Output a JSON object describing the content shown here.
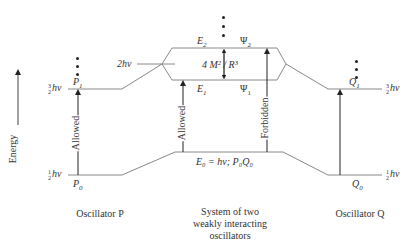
{
  "axis": {
    "label": "Energy"
  },
  "oscillator_p": {
    "caption": "Oscillator P",
    "levels": [
      {
        "state": "P0",
        "energy_label": "1/2 hν",
        "num": "1",
        "den": "2",
        "unit": "hν"
      },
      {
        "state": "P1",
        "energy_label": "3/2 hν",
        "num": "3",
        "den": "2",
        "unit": "hν"
      }
    ],
    "transition": "Allowed",
    "p0": "P",
    "p0_sub": "0",
    "p1": "P",
    "p1_sub": "1"
  },
  "system": {
    "caption_lines": [
      "System of two",
      "weakly interacting",
      "oscillators"
    ],
    "crossing_label": "2hν",
    "e2": "E",
    "e2_sub": "2",
    "psi2": "Ψ",
    "psi2_sub": "2",
    "e1": "E",
    "e1_sub": "1",
    "psi1": "Ψ",
    "psi1_sub": "1",
    "splitting": "4 M² / R³",
    "ground": "E₀ = hν; P₀Q₀",
    "transitions": [
      "Allowed",
      "Forbidden"
    ]
  },
  "oscillator_q": {
    "caption": "Oscillator Q",
    "levels": [
      {
        "state": "Q0",
        "energy_label": "1/2 hν",
        "num": "1",
        "den": "2",
        "unit": "hν"
      },
      {
        "state": "Q1",
        "energy_label": "3/2 hν",
        "num": "3",
        "den": "2",
        "unit": "hν"
      }
    ],
    "q0": "Q",
    "q0_sub": "0",
    "q1": "Q",
    "q1_sub": "1"
  },
  "colors": {
    "line": "#888888",
    "arrow": "#222222",
    "text": "#333333"
  }
}
